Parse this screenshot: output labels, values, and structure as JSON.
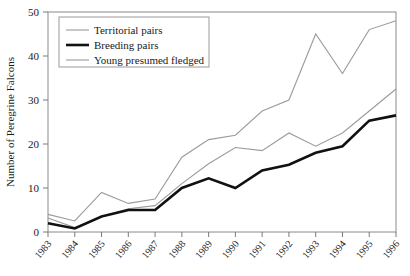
{
  "chart_data": {
    "type": "line",
    "title": "",
    "xlabel": "",
    "ylabel": "Number of Peregrine Falcons",
    "categories": [
      "1983",
      "1984",
      "1985",
      "1986",
      "1987",
      "1988",
      "1989",
      "1990",
      "1991",
      "1992",
      "1993",
      "1994",
      "1995",
      "1996"
    ],
    "x": [
      1983,
      1984,
      1985,
      1986,
      1987,
      1988,
      1989,
      1990,
      1991,
      1992,
      1993,
      1994,
      1995,
      1996
    ],
    "xlim": [
      1983,
      1996
    ],
    "ylim": [
      0,
      50
    ],
    "yticks": [
      0,
      10,
      20,
      30,
      40,
      50
    ],
    "ytick_labels": [
      "0",
      "10",
      "20",
      "30",
      "40",
      "50"
    ],
    "grid": false,
    "legend_position": "top-left",
    "series": [
      {
        "name": "Territorial pairs",
        "color": "#9b9b9b",
        "width": 1.1,
        "values": [
          4,
          2.5,
          9,
          6.5,
          7.5,
          17,
          21,
          22,
          27.5,
          30,
          45,
          36,
          46,
          48
        ]
      },
      {
        "name": "Breeding pairs",
        "color": "#111111",
        "width": 2.6,
        "values": [
          2,
          0.8,
          3.5,
          5,
          5,
          10,
          12.2,
          10,
          14,
          15.3,
          18,
          19.5,
          25.3,
          26.5
        ]
      },
      {
        "name": "Young presumed fledged",
        "color": "#9b9b9b",
        "width": 1.1,
        "values": [
          3.2,
          1,
          3.5,
          5.3,
          6,
          11,
          15.5,
          19.2,
          18.5,
          22.5,
          19.5,
          22.5,
          27.5,
          32.5
        ]
      }
    ]
  },
  "legend": {
    "items": [
      {
        "label": "Territorial pairs"
      },
      {
        "label": "Breeding pairs"
      },
      {
        "label": "Young presumed fledged"
      }
    ]
  }
}
